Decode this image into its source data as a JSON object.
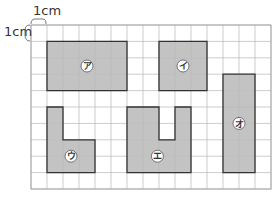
{
  "scale_labels": {
    "horizontal": "1cm",
    "vertical": "1cm"
  },
  "grid": {
    "origin_x": 31,
    "origin_y": 25,
    "cols": 15,
    "rows": 10,
    "cell_w": 16,
    "cell_h": 16.4,
    "line_color": "#b8b8b8",
    "outer_line_color": "#999999"
  },
  "colors": {
    "shape_fill": "#c3c3c3",
    "shape_stroke": "#333333",
    "label_circle_fill": "#ffffff",
    "label_circle_stroke": "#555555"
  },
  "shapes": [
    {
      "id": "a",
      "label": "ア",
      "cells": [
        [
          1,
          1
        ],
        [
          2,
          1
        ],
        [
          3,
          1
        ],
        [
          4,
          1
        ],
        [
          5,
          1
        ],
        [
          1,
          2
        ],
        [
          2,
          2
        ],
        [
          3,
          2
        ],
        [
          4,
          2
        ],
        [
          5,
          2
        ],
        [
          1,
          3
        ],
        [
          2,
          3
        ],
        [
          3,
          3
        ],
        [
          4,
          3
        ],
        [
          5,
          3
        ]
      ],
      "outline": [
        [
          1,
          1
        ],
        [
          6,
          1
        ],
        [
          6,
          4
        ],
        [
          1,
          4
        ]
      ],
      "label_pos": [
        3.5,
        2.5
      ]
    },
    {
      "id": "i",
      "label": "イ",
      "cells": [
        [
          8,
          1
        ],
        [
          9,
          1
        ],
        [
          10,
          1
        ],
        [
          8,
          2
        ],
        [
          9,
          2
        ],
        [
          10,
          2
        ],
        [
          8,
          3
        ],
        [
          9,
          3
        ],
        [
          10,
          3
        ]
      ],
      "outline": [
        [
          8,
          1
        ],
        [
          11,
          1
        ],
        [
          11,
          4
        ],
        [
          8,
          4
        ]
      ],
      "label_pos": [
        9.5,
        2.5
      ]
    },
    {
      "id": "u",
      "label": "ウ",
      "cells": [
        [
          1,
          5
        ],
        [
          1,
          6
        ],
        [
          1,
          7
        ],
        [
          2,
          7
        ],
        [
          3,
          7
        ],
        [
          1,
          8
        ],
        [
          2,
          8
        ],
        [
          3,
          8
        ]
      ],
      "outline": [
        [
          1,
          5
        ],
        [
          2,
          5
        ],
        [
          2,
          7
        ],
        [
          4,
          7
        ],
        [
          4,
          9
        ],
        [
          1,
          9
        ]
      ],
      "label_pos": [
        2.5,
        8.0
      ]
    },
    {
      "id": "e",
      "label": "エ",
      "cells": [
        [
          6,
          5
        ],
        [
          7,
          5
        ],
        [
          9,
          5
        ],
        [
          6,
          6
        ],
        [
          7,
          6
        ],
        [
          9,
          6
        ],
        [
          6,
          7
        ],
        [
          7,
          7
        ],
        [
          8,
          7
        ],
        [
          9,
          7
        ],
        [
          6,
          8
        ],
        [
          7,
          8
        ],
        [
          8,
          8
        ],
        [
          9,
          8
        ]
      ],
      "outline": [
        [
          6,
          5
        ],
        [
          8,
          5
        ],
        [
          8,
          7
        ],
        [
          9,
          7
        ],
        [
          9,
          5
        ],
        [
          10,
          5
        ],
        [
          10,
          9
        ],
        [
          6,
          9
        ]
      ],
      "label_pos": [
        7.9,
        8.0
      ]
    },
    {
      "id": "o",
      "label": "オ",
      "cells": [
        [
          12,
          3
        ],
        [
          13,
          3
        ],
        [
          12,
          4
        ],
        [
          13,
          4
        ],
        [
          12,
          5
        ],
        [
          13,
          5
        ],
        [
          12,
          6
        ],
        [
          13,
          6
        ],
        [
          12,
          7
        ],
        [
          13,
          7
        ],
        [
          12,
          8
        ],
        [
          13,
          8
        ]
      ],
      "outline": [
        [
          12,
          3
        ],
        [
          14,
          3
        ],
        [
          14,
          9
        ],
        [
          12,
          9
        ]
      ],
      "label_pos": [
        13.0,
        6.0
      ]
    }
  ]
}
